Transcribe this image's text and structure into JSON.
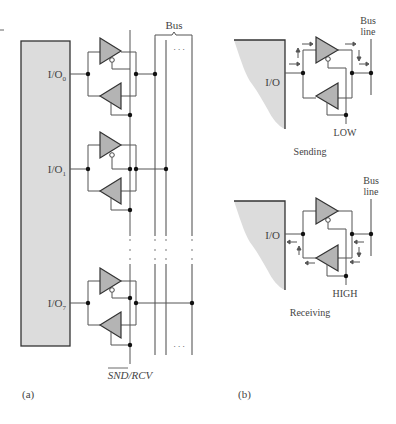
{
  "figure": {
    "panel_a": {
      "label": "(a)",
      "bus_label": "Bus",
      "ports": [
        {
          "name": "I/O",
          "sub": "0"
        },
        {
          "name": "I/O",
          "sub": "1"
        },
        {
          "name": "I/O",
          "sub": "7"
        }
      ],
      "ellipsis": ". . .",
      "control_signal": "SND/RCV"
    },
    "panel_b": {
      "label": "(b)",
      "sending": {
        "port_label": "I/O",
        "bus_line_label_1": "Bus",
        "bus_line_label_2": "line",
        "control_level": "LOW",
        "caption": "Sending"
      },
      "receiving": {
        "port_label": "I/O",
        "bus_line_label_1": "Bus",
        "bus_line_label_2": "line",
        "control_level": "HIGH",
        "caption": "Receiving"
      }
    }
  },
  "colors": {
    "block_fill": "#dcdcdc",
    "buffer_fill": "#b4b4b4",
    "line": "#555555"
  }
}
